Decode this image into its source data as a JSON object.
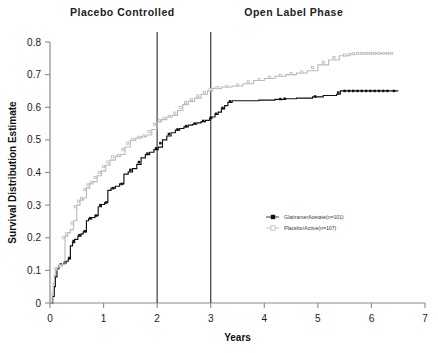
{
  "chart_data": {
    "type": "line",
    "title": "",
    "panel_titles": [
      {
        "label": "Placebo Controlled",
        "x_center": 1.35
      },
      {
        "label": "Open Label Phase",
        "x_center": 4.55
      }
    ],
    "xlabel": "Years",
    "ylabel": "Survival Distribution Estimate",
    "xlim": [
      0,
      7
    ],
    "ylim": [
      0,
      0.8
    ],
    "xticks": [
      0,
      1,
      2,
      3,
      4,
      5,
      6,
      7
    ],
    "xtick_labels": [
      "0",
      "1",
      "2",
      "3",
      "4",
      "5",
      "6",
      "7"
    ],
    "yticks": [
      0,
      0.1,
      0.2,
      0.3,
      0.4,
      0.5,
      0.6,
      0.7,
      0.8
    ],
    "ytick_labels": [
      "0",
      "0.1",
      "0.2",
      "0.3",
      "0.4",
      "0.5",
      "0.6",
      "0.7",
      "0.8"
    ],
    "grid": false,
    "legend_position": "center-right",
    "annotations": [
      {
        "name": "phase-divider-year-2",
        "x": 2.0,
        "type": "vline"
      },
      {
        "name": "phase-divider-year-3",
        "x": 3.0,
        "type": "vline"
      }
    ],
    "series": [
      {
        "name": "GlatiramerAcetate(n=101)",
        "color": "#111111",
        "marker": "filled-square",
        "step_points": [
          [
            0.02,
            0.0
          ],
          [
            0.05,
            0.02
          ],
          [
            0.08,
            0.05
          ],
          [
            0.1,
            0.08
          ],
          [
            0.13,
            0.105
          ],
          [
            0.17,
            0.115
          ],
          [
            0.22,
            0.118
          ],
          [
            0.26,
            0.122
          ],
          [
            0.3,
            0.128
          ],
          [
            0.34,
            0.135
          ],
          [
            0.38,
            0.175
          ],
          [
            0.42,
            0.185
          ],
          [
            0.46,
            0.195
          ],
          [
            0.52,
            0.205
          ],
          [
            0.58,
            0.212
          ],
          [
            0.62,
            0.218
          ],
          [
            0.68,
            0.252
          ],
          [
            0.72,
            0.258
          ],
          [
            0.78,
            0.262
          ],
          [
            0.84,
            0.268
          ],
          [
            0.9,
            0.295
          ],
          [
            0.96,
            0.302
          ],
          [
            1.02,
            0.308
          ],
          [
            1.08,
            0.345
          ],
          [
            1.14,
            0.352
          ],
          [
            1.22,
            0.358
          ],
          [
            1.3,
            0.365
          ],
          [
            1.38,
            0.395
          ],
          [
            1.46,
            0.402
          ],
          [
            1.54,
            0.412
          ],
          [
            1.62,
            0.425
          ],
          [
            1.7,
            0.445
          ],
          [
            1.78,
            0.455
          ],
          [
            1.86,
            0.462
          ],
          [
            1.94,
            0.47
          ],
          [
            2.02,
            0.478
          ],
          [
            2.1,
            0.5
          ],
          [
            2.18,
            0.512
          ],
          [
            2.26,
            0.522
          ],
          [
            2.34,
            0.53
          ],
          [
            2.42,
            0.535
          ],
          [
            2.5,
            0.54
          ],
          [
            2.58,
            0.545
          ],
          [
            2.66,
            0.548
          ],
          [
            2.74,
            0.552
          ],
          [
            2.82,
            0.556
          ],
          [
            2.9,
            0.56
          ],
          [
            2.98,
            0.565
          ],
          [
            3.02,
            0.57
          ],
          [
            3.08,
            0.578
          ],
          [
            3.14,
            0.585
          ],
          [
            3.2,
            0.595
          ],
          [
            3.26,
            0.605
          ],
          [
            3.32,
            0.615
          ],
          [
            3.4,
            0.62
          ],
          [
            3.6,
            0.62
          ],
          [
            3.9,
            0.622
          ],
          [
            4.2,
            0.624
          ],
          [
            4.4,
            0.626
          ],
          [
            4.6,
            0.628
          ],
          [
            4.9,
            0.632
          ],
          [
            5.1,
            0.636
          ],
          [
            5.35,
            0.64
          ],
          [
            5.42,
            0.65
          ],
          [
            6.5,
            0.65
          ]
        ],
        "censor_marks": [
          [
            0.12,
            0.105
          ],
          [
            0.2,
            0.118
          ],
          [
            0.28,
            0.125
          ],
          [
            0.36,
            0.138
          ],
          [
            0.44,
            0.19
          ],
          [
            0.55,
            0.208
          ],
          [
            0.65,
            0.22
          ],
          [
            0.75,
            0.26
          ],
          [
            0.86,
            0.268
          ],
          [
            0.94,
            0.3
          ],
          [
            1.05,
            0.308
          ],
          [
            1.18,
            0.352
          ],
          [
            1.34,
            0.365
          ],
          [
            1.5,
            0.408
          ],
          [
            1.66,
            0.432
          ],
          [
            1.82,
            0.458
          ],
          [
            1.98,
            0.474
          ],
          [
            2.06,
            0.49
          ],
          [
            2.22,
            0.518
          ],
          [
            2.38,
            0.532
          ],
          [
            2.54,
            0.542
          ],
          [
            2.7,
            0.55
          ],
          [
            2.86,
            0.558
          ],
          [
            3.0,
            0.568
          ],
          [
            3.1,
            0.58
          ],
          [
            3.22,
            0.598
          ],
          [
            3.36,
            0.618
          ],
          [
            4.3,
            0.625
          ],
          [
            4.38,
            0.626
          ],
          [
            4.95,
            0.633
          ],
          [
            5.38,
            0.645
          ],
          [
            5.5,
            0.65
          ],
          [
            5.58,
            0.65
          ],
          [
            5.66,
            0.65
          ],
          [
            5.74,
            0.65
          ],
          [
            5.82,
            0.65
          ],
          [
            5.9,
            0.65
          ],
          [
            5.98,
            0.65
          ],
          [
            6.06,
            0.65
          ],
          [
            6.14,
            0.65
          ],
          [
            6.22,
            0.65
          ],
          [
            6.3,
            0.65
          ],
          [
            6.42,
            0.65
          ]
        ]
      },
      {
        "name": "Placebo/Active(n=107)",
        "color": "#b9b9b9",
        "marker": "open-square",
        "step_points": [
          [
            0.02,
            0.0
          ],
          [
            0.04,
            0.03
          ],
          [
            0.06,
            0.06
          ],
          [
            0.08,
            0.085
          ],
          [
            0.1,
            0.1
          ],
          [
            0.13,
            0.108
          ],
          [
            0.17,
            0.112
          ],
          [
            0.22,
            0.118
          ],
          [
            0.28,
            0.205
          ],
          [
            0.33,
            0.215
          ],
          [
            0.38,
            0.225
          ],
          [
            0.44,
            0.252
          ],
          [
            0.5,
            0.3
          ],
          [
            0.56,
            0.315
          ],
          [
            0.62,
            0.322
          ],
          [
            0.68,
            0.352
          ],
          [
            0.74,
            0.365
          ],
          [
            0.8,
            0.372
          ],
          [
            0.88,
            0.39
          ],
          [
            0.96,
            0.405
          ],
          [
            1.04,
            0.422
          ],
          [
            1.12,
            0.438
          ],
          [
            1.22,
            0.45
          ],
          [
            1.32,
            0.455
          ],
          [
            1.4,
            0.478
          ],
          [
            1.5,
            0.498
          ],
          [
            1.6,
            0.505
          ],
          [
            1.7,
            0.51
          ],
          [
            1.8,
            0.515
          ],
          [
            1.9,
            0.532
          ],
          [
            2.0,
            0.555
          ],
          [
            2.08,
            0.562
          ],
          [
            2.18,
            0.57
          ],
          [
            2.28,
            0.575
          ],
          [
            2.38,
            0.59
          ],
          [
            2.48,
            0.608
          ],
          [
            2.58,
            0.618
          ],
          [
            2.7,
            0.628
          ],
          [
            2.82,
            0.64
          ],
          [
            2.94,
            0.65
          ],
          [
            3.04,
            0.658
          ],
          [
            3.2,
            0.662
          ],
          [
            3.4,
            0.665
          ],
          [
            3.6,
            0.672
          ],
          [
            3.8,
            0.682
          ],
          [
            4.0,
            0.688
          ],
          [
            4.2,
            0.695
          ],
          [
            4.4,
            0.7
          ],
          [
            4.6,
            0.705
          ],
          [
            4.8,
            0.712
          ],
          [
            5.0,
            0.73
          ],
          [
            5.2,
            0.745
          ],
          [
            5.4,
            0.758
          ],
          [
            5.6,
            0.763
          ],
          [
            5.8,
            0.765
          ],
          [
            6.4,
            0.765
          ]
        ],
        "censor_marks": [
          [
            0.11,
            0.106
          ],
          [
            0.19,
            0.114
          ],
          [
            0.25,
            0.2
          ],
          [
            0.31,
            0.212
          ],
          [
            0.41,
            0.245
          ],
          [
            0.47,
            0.295
          ],
          [
            0.53,
            0.312
          ],
          [
            0.59,
            0.32
          ],
          [
            0.65,
            0.348
          ],
          [
            0.71,
            0.362
          ],
          [
            0.77,
            0.37
          ],
          [
            0.84,
            0.385
          ],
          [
            0.92,
            0.4
          ],
          [
            1.0,
            0.418
          ],
          [
            1.08,
            0.432
          ],
          [
            1.17,
            0.448
          ],
          [
            1.27,
            0.452
          ],
          [
            1.36,
            0.47
          ],
          [
            1.45,
            0.49
          ],
          [
            1.55,
            0.502
          ],
          [
            1.65,
            0.508
          ],
          [
            1.75,
            0.512
          ],
          [
            1.85,
            0.525
          ],
          [
            1.95,
            0.548
          ],
          [
            2.04,
            0.56
          ],
          [
            2.13,
            0.566
          ],
          [
            2.23,
            0.572
          ],
          [
            2.33,
            0.582
          ],
          [
            2.43,
            0.6
          ],
          [
            2.53,
            0.614
          ],
          [
            2.64,
            0.624
          ],
          [
            2.76,
            0.635
          ],
          [
            2.88,
            0.646
          ],
          [
            2.99,
            0.655
          ],
          [
            3.12,
            0.66
          ],
          [
            3.3,
            0.664
          ],
          [
            3.5,
            0.668
          ],
          [
            3.7,
            0.678
          ],
          [
            3.9,
            0.685
          ],
          [
            4.1,
            0.692
          ],
          [
            4.3,
            0.698
          ],
          [
            4.5,
            0.703
          ],
          [
            4.7,
            0.708
          ],
          [
            4.9,
            0.722
          ],
          [
            5.1,
            0.738
          ],
          [
            5.3,
            0.752
          ],
          [
            5.5,
            0.76
          ],
          [
            5.58,
            0.762
          ],
          [
            5.66,
            0.764
          ],
          [
            5.74,
            0.765
          ],
          [
            5.82,
            0.765
          ],
          [
            5.9,
            0.765
          ],
          [
            5.98,
            0.765
          ],
          [
            6.06,
            0.765
          ],
          [
            6.14,
            0.765
          ],
          [
            6.22,
            0.765
          ],
          [
            6.3,
            0.765
          ],
          [
            6.38,
            0.765
          ]
        ]
      }
    ]
  },
  "legend": {
    "entries": [
      {
        "label": "GlatiramerAcetate(n=101)",
        "color": "#111111",
        "marker": "filled-square"
      },
      {
        "label": "Placebo/Active(n=107)",
        "color": "#b9b9b9",
        "marker": "open-square"
      }
    ]
  },
  "colors": {
    "treatment": "#111111",
    "control": "#b9b9b9",
    "axis": "#8a8a8a",
    "divider": "#4a4a4a",
    "background": "#ffffff"
  }
}
